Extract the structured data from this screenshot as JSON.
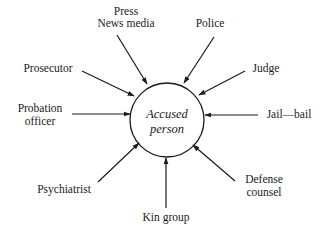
{
  "diagram": {
    "type": "hub-and-spoke",
    "center": {
      "lines": [
        "Accused",
        "person"
      ],
      "x": 167,
      "y": 120,
      "r": 37
    },
    "nodes": [
      {
        "id": "press-news-media",
        "lines": [
          "Press",
          "News media"
        ],
        "lx": 126,
        "ly": [
          15,
          27
        ],
        "from": [
          117,
          35
        ],
        "to": [
          147,
          84
        ]
      },
      {
        "id": "police",
        "lines": [
          "Police"
        ],
        "lx": 210,
        "ly": [
          27
        ],
        "from": [
          214,
          37
        ],
        "to": [
          184,
          83
        ]
      },
      {
        "id": "prosecutor",
        "lines": [
          "Prosecutor"
        ],
        "lx": 48,
        "ly": [
          72
        ],
        "from": [
          82,
          71
        ],
        "to": [
          134,
          96
        ]
      },
      {
        "id": "judge",
        "lines": [
          "Judge"
        ],
        "lx": 266,
        "ly": [
          72
        ],
        "from": [
          245,
          71
        ],
        "to": [
          199,
          95
        ]
      },
      {
        "id": "probation-officer",
        "lines": [
          "Probation",
          "officer"
        ],
        "lx": 40,
        "ly": [
          112,
          125
        ],
        "from": [
          72,
          114
        ],
        "to": [
          130,
          114
        ]
      },
      {
        "id": "jail-bail",
        "lines": [
          "Jail—bail"
        ],
        "lx": 289,
        "ly": [
          118
        ],
        "from": [
          258,
          115
        ],
        "to": [
          205,
          115
        ]
      },
      {
        "id": "psychiatrist",
        "lines": [
          "Psychiatrist"
        ],
        "lx": 64,
        "ly": [
          193
        ],
        "from": [
          98,
          182
        ],
        "to": [
          139,
          143
        ]
      },
      {
        "id": "defense-counsel",
        "lines": [
          "Defense",
          "counsel"
        ],
        "lx": 264,
        "ly": [
          183,
          196
        ],
        "from": [
          235,
          181
        ],
        "to": [
          193,
          145
        ]
      },
      {
        "id": "kin-group",
        "lines": [
          "Kin group"
        ],
        "lx": 166,
        "ly": [
          221
        ],
        "from": [
          166,
          208
        ],
        "to": [
          166,
          158
        ]
      }
    ],
    "colors": {
      "ink": "#1a1a1a",
      "background": "#ffffff"
    }
  }
}
